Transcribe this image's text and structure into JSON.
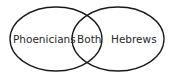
{
  "diagram": {
    "type": "venn",
    "stroke_color": "#1a1a1a",
    "sets": [
      {
        "label": "Phoenicians",
        "id": "left"
      },
      {
        "label": "Hebrews",
        "id": "right"
      }
    ],
    "intersection": {
      "label": "Both"
    }
  }
}
